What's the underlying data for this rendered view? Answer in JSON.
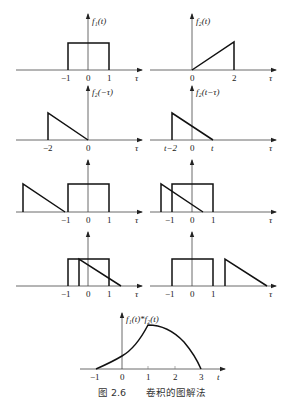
{
  "figure": {
    "caption": "图 2.6    卷积的图解法",
    "caption_number": "图 2.6",
    "caption_text": "卷积的图解法"
  },
  "panels": [
    {
      "id": "f1",
      "label": "f₁(t)",
      "x_axis_label": "τ",
      "ticks": [
        "−1",
        "0",
        "1"
      ],
      "shape": "rectangle from −1 to 1"
    },
    {
      "id": "f2",
      "label": "f₂(t)",
      "x_axis_label": "τ",
      "ticks": [
        "0",
        "2"
      ],
      "shape": "ramp from 0 to 2"
    },
    {
      "id": "f2-flip",
      "label": "f₂(−τ)",
      "x_axis_label": "τ",
      "ticks": [
        "−2",
        "0"
      ],
      "shape": "falling ramp from −2 to 0"
    },
    {
      "id": "f2-shift",
      "label": "f₂(t−τ)",
      "x_axis_label": "τ",
      "ticks": [
        "t−2",
        "0",
        "t"
      ],
      "shape": "falling ramp from t−2 to t"
    },
    {
      "id": "case-a",
      "label": "",
      "x_axis_label": "τ",
      "ticks": [
        "−1",
        "0",
        "1"
      ],
      "shape": "no overlap, t < −1"
    },
    {
      "id": "case-b",
      "label": "",
      "x_axis_label": "τ",
      "ticks": [
        "−1",
        "0",
        "1"
      ],
      "shape": "partial overlap"
    },
    {
      "id": "case-c",
      "label": "",
      "x_axis_label": "τ",
      "ticks": [
        "−1",
        "0",
        "1"
      ],
      "shape": "overlap, 1 < t < 3"
    },
    {
      "id": "case-d",
      "label": "",
      "x_axis_label": "τ",
      "ticks": [
        "−1",
        "0",
        "1"
      ],
      "shape": "no overlap, t > 3"
    },
    {
      "id": "result",
      "label": "f₁(t)*f₂(t)",
      "x_axis_label": "t",
      "ticks": [
        "−1",
        "0",
        "1",
        "2",
        "3"
      ],
      "shape": "convolution result from −1 to 3, peak at t=1"
    }
  ],
  "labels": {
    "f1": "f₁(t)",
    "f2": "f₂(t)",
    "f2_flip": "f₂(−τ)",
    "f2_shift": "f₂(t−τ)",
    "result": "f₁(t)*f₂(t)",
    "tau": "τ",
    "t": "t",
    "tick_m1": "−1",
    "tick_0": "0",
    "tick_1": "1",
    "tick_2": "2",
    "tick_3": "3",
    "tick_m2": "−2",
    "tick_tm2": "t−2"
  },
  "colors": {
    "line": "#111111",
    "axis": "#444444",
    "background": "#ffffff"
  }
}
